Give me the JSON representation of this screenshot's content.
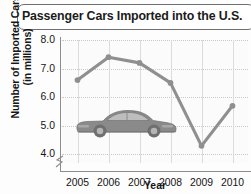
{
  "chart_data": {
    "type": "line",
    "title": "Passenger Cars Imported into the U.S.",
    "xlabel": "Year",
    "ylabel_line1": "Number of Imported Cars",
    "ylabel_line2": "(in millions)",
    "categories": [
      "2005",
      "2006",
      "2007",
      "2008",
      "2009",
      "2010"
    ],
    "values": [
      6.6,
      7.4,
      7.2,
      6.5,
      4.3,
      5.7
    ],
    "ylim": [
      3.7,
      8.0
    ],
    "yticks": [
      "8.0",
      "7.0",
      "6.0",
      "5.0",
      "4.0"
    ],
    "ytick_values": [
      8.0,
      7.0,
      6.0,
      5.0,
      4.0
    ],
    "grid": true,
    "legend": "none",
    "axis_break": true,
    "series_color": "#8f8f8f",
    "marker_color": "#8f8f8f",
    "grid_color": "#c9c9c9",
    "axis_color": "#8d8d8d",
    "title_border_color": "#6f6f6f",
    "annotation_image": "sports-car-illustration"
  }
}
